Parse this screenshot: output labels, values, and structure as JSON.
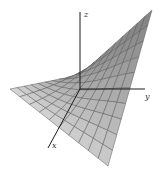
{
  "figure": {
    "type": "3d-surface-plot",
    "axes": {
      "x": {
        "label": "x",
        "from": [
          80,
          89
        ],
        "to": [
          48,
          148
        ],
        "label_pos": [
          52,
          148
        ]
      },
      "y": {
        "label": "y",
        "from": [
          80,
          89
        ],
        "to": [
          145,
          89
        ],
        "label_pos": [
          145,
          99
        ]
      },
      "z": {
        "label": "z",
        "from": [
          80,
          89
        ],
        "to": [
          80,
          12
        ],
        "label_pos": [
          84,
          17
        ]
      }
    },
    "surface": {
      "grid_divisions": 10,
      "corners": {
        "back": [
          80,
          75
        ],
        "left": [
          10,
          89
        ],
        "right_top": [
          152,
          10
        ],
        "front_bottom": [
          108,
          166
        ]
      },
      "colors": {
        "light": "#d4d4d4",
        "dark": "#7c7c7c",
        "grid_line": "#5a5a5a",
        "axis": "#1a1a1a"
      }
    }
  }
}
